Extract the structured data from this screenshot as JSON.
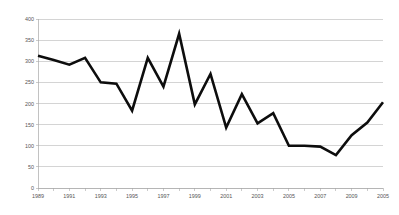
{
  "chart_data": {
    "type": "line",
    "title": "",
    "subtitle": "",
    "xlabel": "",
    "ylabel": "",
    "legend": [],
    "legend_position": "none",
    "grid": true,
    "grid_axis": "y",
    "xlim": [
      1989,
      2012
    ],
    "ylim": [
      0,
      400
    ],
    "yticks": [
      0,
      50,
      100,
      150,
      200,
      250,
      300,
      350,
      400
    ],
    "ytick_labels": [
      "0",
      "50",
      "100",
      "150",
      "200",
      "250",
      "300",
      "350",
      "400"
    ],
    "xticks": [
      1989,
      1991,
      1993,
      1995,
      1997,
      1999,
      2001,
      2003,
      2005,
      2007,
      2009,
      2011
    ],
    "xtick_labels": [
      "1989",
      "1991",
      "1993",
      "1995",
      "1997",
      "1999",
      "2001",
      "2003",
      "2005",
      "2007",
      "2009",
      "2005"
    ],
    "x": [
      1989,
      1990,
      1991,
      1992,
      1993,
      1994,
      1995,
      1996,
      1997,
      1998,
      1999,
      2000,
      2001,
      2002,
      2003,
      2004,
      2005,
      2006,
      2007,
      2008,
      2009,
      2010,
      2011
    ],
    "series": [
      {
        "name": "series-1",
        "color": "#0d0d0d",
        "values": [
          313,
          303,
          292,
          308,
          250,
          247,
          183,
          308,
          240,
          365,
          198,
          270,
          143,
          222,
          153,
          177,
          100,
          100,
          98,
          78,
          125,
          155,
          203
        ]
      }
    ],
    "colors": {
      "line": "#0d0d0d",
      "grid": "#b8b8b8",
      "axis": "#a8a8a8",
      "tick_text": "#555555",
      "background": "#ffffff"
    },
    "plot_area": {
      "left": 38,
      "top": 19,
      "right": 383,
      "bottom": 188
    }
  }
}
